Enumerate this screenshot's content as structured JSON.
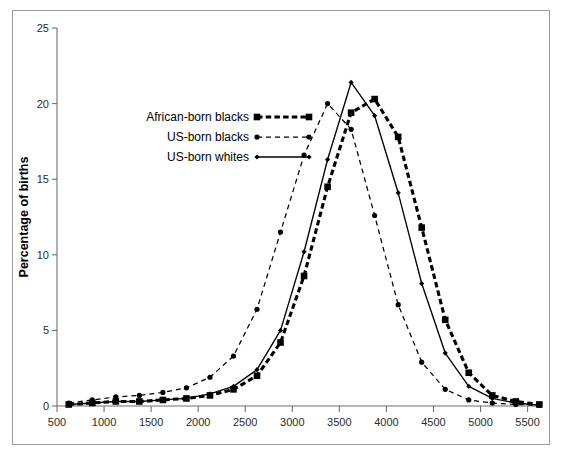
{
  "chart_data": {
    "type": "line",
    "title": "",
    "xlabel": "Birth weight (g)",
    "ylabel": "Percentage of births",
    "xlim": [
      500,
      5600
    ],
    "ylim": [
      0,
      25
    ],
    "xticks": [
      500,
      1000,
      1500,
      2000,
      2500,
      3000,
      3500,
      4000,
      4500,
      5000,
      5500
    ],
    "yticks": [
      0,
      5,
      10,
      15,
      20,
      25
    ],
    "grid": false,
    "legend_position": "upper-left-inside",
    "x": [
      625,
      875,
      1125,
      1375,
      1625,
      1875,
      2125,
      2375,
      2625,
      2875,
      3125,
      3375,
      3625,
      3875,
      4125,
      4375,
      4625,
      4875,
      5125,
      5375,
      5625
    ],
    "series": [
      {
        "name": "African-born blacks",
        "line_style": "thick-dashed",
        "marker": "square",
        "values": [
          0.1,
          0.2,
          0.3,
          0.3,
          0.4,
          0.5,
          0.7,
          1.1,
          2.0,
          4.2,
          8.6,
          14.5,
          19.4,
          20.3,
          17.8,
          11.8,
          5.7,
          2.2,
          0.7,
          0.3,
          0.1
        ]
      },
      {
        "name": "US-born blacks",
        "line_style": "thin-dashed",
        "marker": "circle",
        "values": [
          0.2,
          0.4,
          0.6,
          0.7,
          0.9,
          1.2,
          1.9,
          3.3,
          6.4,
          11.5,
          16.6,
          20.0,
          18.3,
          12.6,
          6.7,
          2.9,
          1.1,
          0.4,
          0.2,
          0.1,
          0.05
        ]
      },
      {
        "name": "US-born whites",
        "line_style": "solid",
        "marker": "diamond",
        "values": [
          0.1,
          0.2,
          0.3,
          0.3,
          0.4,
          0.5,
          0.8,
          1.3,
          2.4,
          5.0,
          10.2,
          16.3,
          21.4,
          19.2,
          14.1,
          8.1,
          3.5,
          1.3,
          0.5,
          0.2,
          0.05
        ]
      }
    ]
  },
  "legend": {
    "items": [
      {
        "label": "African-born blacks"
      },
      {
        "label": "US-born blacks"
      },
      {
        "label": "US-born whites"
      }
    ]
  }
}
